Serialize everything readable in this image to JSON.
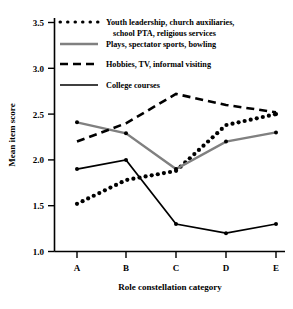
{
  "chart_data": {
    "type": "line",
    "title": "",
    "xlabel": "Role constellation category",
    "ylabel": "Mean item score",
    "categories": [
      "A",
      "B",
      "C",
      "D",
      "E"
    ],
    "ylim": [
      1.0,
      3.5
    ],
    "yticks": [
      "1.0",
      "1.5",
      "2.0",
      "2.5",
      "3.0",
      "3.5"
    ],
    "ytick_values": [
      1.0,
      1.5,
      2.0,
      2.5,
      3.0,
      3.5
    ],
    "grid": false,
    "legend_position": "top-right-inside",
    "series": [
      {
        "name": "Youth leadership, church auxiliaries, school PTA, religious services",
        "style": "dotted",
        "color": "#000000",
        "values": [
          1.52,
          1.78,
          1.88,
          2.38,
          2.5
        ]
      },
      {
        "name": "Plays, spectator sports, bowling",
        "style": "solid",
        "color": "#808080",
        "values": [
          2.41,
          2.29,
          1.9,
          2.2,
          2.3
        ]
      },
      {
        "name": "Hobbies, TV, informal visiting",
        "style": "dashed",
        "color": "#000000",
        "values": [
          2.2,
          2.4,
          2.72,
          2.6,
          2.52
        ]
      },
      {
        "name": "College courses",
        "style": "solid",
        "color": "#000000",
        "values": [
          1.9,
          2.0,
          1.3,
          1.2,
          1.3
        ]
      }
    ]
  },
  "legend": {
    "entries": [
      {
        "line1": "Youth leadership, church auxiliaries,",
        "line2": "school PTA, religious services"
      },
      {
        "line1": "Plays, spectator sports, bowling",
        "line2": ""
      },
      {
        "line1": "Hobbies, TV, informal visiting",
        "line2": ""
      },
      {
        "line1": "College courses",
        "line2": ""
      }
    ]
  },
  "axes": {
    "y_title": "Mean item score",
    "x_title": "Role constellation category",
    "y_labels": [
      "3.5",
      "3.0",
      "2.5",
      "2.0",
      "1.5",
      "1.0"
    ],
    "x_labels": [
      "A",
      "B",
      "C",
      "D",
      "E"
    ]
  }
}
